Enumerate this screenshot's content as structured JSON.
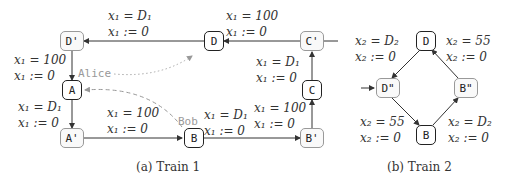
{
  "train1": {
    "caption": "(a) Train 1",
    "nodes": {
      "D_prime": "D'",
      "D": "D",
      "C_prime": "C'",
      "C": "C",
      "A": "A",
      "A_prime": "A'",
      "B": "B",
      "B_prime": "B'"
    },
    "edges": {
      "D_to_Dprime": [
        "x₁ = D₁",
        "x₁ := 0"
      ],
      "Cprime_to_D": [
        "x₁ = 100",
        "x₁ := 0"
      ],
      "Dprime_to_A": [
        "x₁ = 100",
        "x₁ := 0"
      ],
      "C_to_Cprime": [
        "x₁ = D₁",
        "x₁ := 0"
      ],
      "A_to_Aprime": [
        "x₁ = D₁",
        "x₁ := 0"
      ],
      "Aprime_to_B": [
        "x₁ = 100",
        "x₁ := 0"
      ],
      "B_to_Bprime": [
        "x₁ = D₁",
        "x₁ := 0"
      ],
      "Bprime_to_C": [
        "x₁ = 100",
        "x₁ := 0"
      ]
    },
    "agents": {
      "alice": "Alice",
      "bob": "Bob"
    }
  },
  "train2": {
    "caption": "(b) Train 2",
    "nodes": {
      "D": "D",
      "D_dprime": "D\"",
      "B_dprime": "B\"",
      "B": "B"
    },
    "edges": {
      "D_to_Ddprime": [
        "x₂ = D₂",
        "x₂ := 0"
      ],
      "Bdprime_to_D": [
        "x₂ = 55",
        "x₂ := 0"
      ],
      "Ddprime_to_B": [
        "x₂ = 55",
        "x₂ := 0"
      ],
      "B_to_Bdprime": [
        "x₂ = D₂",
        "x₂ := 0"
      ]
    }
  }
}
